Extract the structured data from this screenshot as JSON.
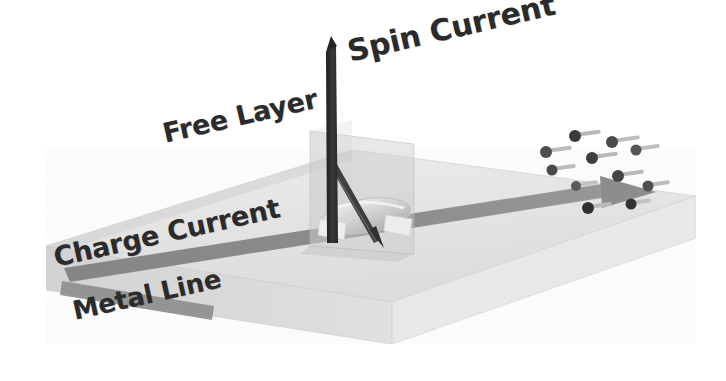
{
  "figure": {
    "kind": "spin-transfer-torque-device-schematic",
    "background_color": "#ffffff"
  },
  "labels": {
    "spin_current": "Spin Current",
    "free_layer": "Free Layer",
    "charge_current": "Charge Current",
    "metal_line": "Metal Line"
  },
  "colors": {
    "slab_top": "#e3e3e3",
    "slab_front": "#d8d8d8",
    "slab_right": "#ececec",
    "slab_left_end": "#cfcfcf",
    "charge_stripe": "#8f8f8f",
    "charge_stripe_dark": "#7a7a7a",
    "spin_arrow": "#2e2e2e",
    "free_layer_disc": "#d0d0d0",
    "free_layer_arrow": "#3a3a3a",
    "pillar_glass": "rgba(200,200,200,0.42)",
    "electron_dot": "#3a3a3a",
    "electron_tail": "#b6b6b6",
    "label_text": "#2b2b2b"
  },
  "geometry": {
    "slab": {
      "top_face": "46,246 352,150 696,196 392,302",
      "front_face": "46,246 392,302 392,344 46,290",
      "right_face": "696,196 696,238 392,344 392,302",
      "left_end_face": "46,246 352,150 352,192 46,290"
    },
    "charge_stripe": {
      "body": "70,268 612,187 640,192 618,200 74,282",
      "arrow_head": "612,181 652,193 610,206"
    },
    "spin_arrow": {
      "x": 330,
      "top_y": 40,
      "bottom_y": 243,
      "width": 9,
      "direction": "up"
    },
    "pillar": {
      "left": 310,
      "top": 131,
      "width": 104,
      "height": 123
    },
    "free_layer_disc": {
      "cx": 365,
      "cy": 215,
      "rx": 44,
      "ry": 17
    },
    "free_layer_arrow": {
      "tip_x": 377,
      "tip_y": 244,
      "tail_x": 329,
      "tail_y": 163,
      "direction": "down"
    }
  },
  "electrons": [
    {
      "x": 575,
      "y": 136,
      "tail": 26
    },
    {
      "x": 612,
      "y": 142,
      "tail": 28
    },
    {
      "x": 546,
      "y": 152,
      "tail": 26
    },
    {
      "x": 592,
      "y": 158,
      "tail": 26
    },
    {
      "x": 636,
      "y": 150,
      "tail": 24
    },
    {
      "x": 552,
      "y": 170,
      "tail": 24
    },
    {
      "x": 618,
      "y": 176,
      "tail": 26
    },
    {
      "x": 576,
      "y": 186,
      "tail": 22
    },
    {
      "x": 648,
      "y": 186,
      "tail": 22
    },
    {
      "x": 588,
      "y": 208,
      "tail": 24
    },
    {
      "x": 631,
      "y": 204,
      "tail": 20
    }
  ]
}
